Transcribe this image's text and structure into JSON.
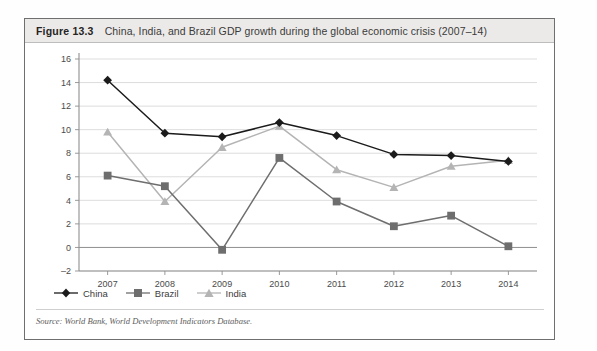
{
  "figure": {
    "number": "Figure 13.3",
    "title": "China, India, and Brazil GDP growth during the global economic crisis (2007–14)",
    "source": "Source: World Bank, World Development Indicators Database."
  },
  "legend": {
    "position": "bottom-left",
    "items": [
      {
        "label": "China",
        "marker": "diamond-marker",
        "color": "#1b1b1b"
      },
      {
        "label": "Brazil",
        "marker": "square-marker",
        "color": "#6e6e6e"
      },
      {
        "label": "India",
        "marker": "triangle-marker",
        "color": "#b4b4b4"
      }
    ]
  },
  "chart_data": {
    "type": "line",
    "title": "China, India, and Brazil GDP growth during the global economic crisis (2007–14)",
    "xlabel": "",
    "ylabel": "",
    "categories": [
      "2007",
      "2008",
      "2009",
      "2010",
      "2011",
      "2012",
      "2013",
      "2014"
    ],
    "x": [
      2007,
      2008,
      2009,
      2010,
      2011,
      2012,
      2013,
      2014
    ],
    "series": [
      {
        "name": "China",
        "color": "#1b1b1b",
        "marker": "diamond",
        "values": [
          14.2,
          9.7,
          9.4,
          10.6,
          9.5,
          7.9,
          7.8,
          7.3
        ]
      },
      {
        "name": "Brazil",
        "color": "#6e6e6e",
        "marker": "square",
        "values": [
          6.1,
          5.2,
          -0.2,
          7.6,
          3.9,
          1.8,
          2.7,
          0.1
        ]
      },
      {
        "name": "India",
        "color": "#b4b4b4",
        "marker": "triangle",
        "values": [
          9.8,
          3.9,
          8.5,
          10.3,
          6.6,
          5.1,
          6.9,
          7.4
        ]
      }
    ],
    "ylim": [
      -2,
      16
    ],
    "ytick_step": 2,
    "yticks": [
      16,
      14,
      12,
      10,
      8,
      6,
      4,
      2,
      0,
      -2
    ],
    "ytick_labels": [
      "16",
      "14",
      "12",
      "10",
      "8",
      "6",
      "4",
      "2",
      "0",
      "–2"
    ],
    "grid": "horizontal",
    "legend_position": "bottom-left"
  }
}
